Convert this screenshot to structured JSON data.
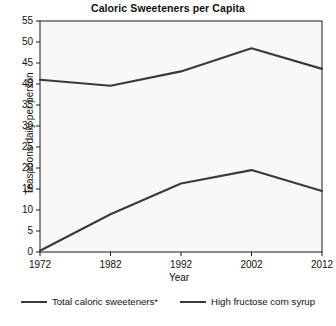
{
  "chart_data": {
    "type": "line",
    "title": "Caloric Sweeteners per Capita",
    "xlabel": "Year",
    "ylabel": "Teaspoons daily per person",
    "x": [
      1972,
      1982,
      1992,
      2002,
      2012
    ],
    "xticklabels": [
      "1972",
      "1982",
      "1992",
      "2002",
      "2012"
    ],
    "yticklabels": [
      "0",
      "5",
      "10",
      "15",
      "20",
      "25",
      "30",
      "35",
      "40",
      "45",
      "50",
      "55"
    ],
    "yticks": [
      0,
      5,
      10,
      15,
      20,
      25,
      30,
      35,
      40,
      45,
      50,
      55
    ],
    "ylim": [
      0,
      55
    ],
    "xlim": [
      1972,
      2012
    ],
    "grid": false,
    "legend_position": "bottom",
    "series": [
      {
        "name": "Total caloric sweeteners*",
        "values": [
          41.0,
          39.6,
          43.0,
          48.5,
          43.6
        ],
        "color": "#3a3a3a"
      },
      {
        "name": "High fructose corn syrup",
        "values": [
          0.3,
          9.0,
          16.3,
          19.5,
          14.5
        ],
        "color": "#3a3a3a"
      }
    ]
  },
  "legend": {
    "items": [
      {
        "label": "Total caloric sweeteners*"
      },
      {
        "label": "High fructose corn syrup"
      }
    ]
  },
  "footnote": {
    "text": ""
  },
  "colors": {
    "line": "#3a3a3a",
    "axis": "#1a1a1a",
    "plot_background": "#f8f8f8"
  }
}
